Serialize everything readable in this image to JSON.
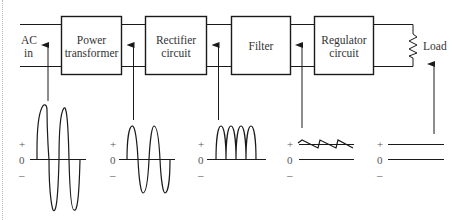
{
  "diagram": {
    "input_label": [
      "AC",
      "in"
    ],
    "blocks": [
      {
        "id": "power-transformer",
        "lines": [
          "Power",
          "transformer"
        ]
      },
      {
        "id": "rectifier-circuit",
        "lines": [
          "Rectifier",
          "circuit"
        ]
      },
      {
        "id": "filter",
        "lines": [
          "Filter"
        ]
      },
      {
        "id": "regulator-circuit",
        "lines": [
          "Regulator",
          "circuit"
        ]
      }
    ],
    "load_label": "Load",
    "waveforms": [
      {
        "stage": "AC input",
        "shape": "high-amplitude sine",
        "axis": {
          "plus": "+",
          "zero": "0",
          "minus": "–"
        }
      },
      {
        "stage": "After transformer",
        "shape": "reduced-amplitude sine",
        "axis": {
          "plus": "+",
          "zero": "0",
          "minus": "–"
        }
      },
      {
        "stage": "After rectifier",
        "shape": "full-wave rectified pulses",
        "axis": {
          "plus": "+",
          "zero": "0",
          "minus": "–"
        }
      },
      {
        "stage": "After filter",
        "shape": "DC with sawtooth ripple",
        "axis": {
          "plus": "+",
          "zero": "0",
          "minus": "–"
        }
      },
      {
        "stage": "After regulator",
        "shape": "constant DC",
        "axis": {
          "plus": "+",
          "zero": "0",
          "minus": "–"
        }
      }
    ],
    "colors": {
      "line": "#1a1a1a",
      "text": "#333333",
      "background": "#ffffff"
    }
  }
}
